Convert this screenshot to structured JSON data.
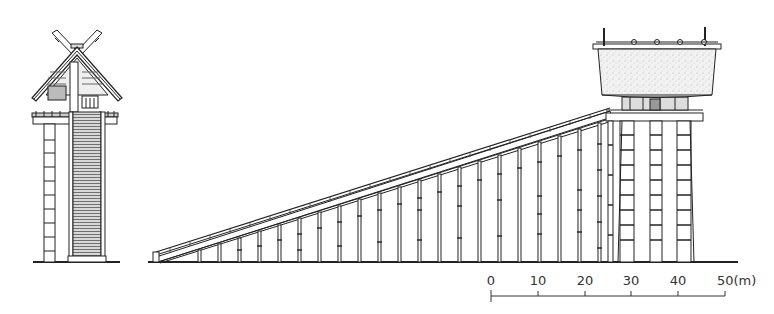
{
  "figure": {
    "type": "architectural-elevation",
    "views": [
      {
        "name": "front-elevation",
        "description": "Front view of elevated shrine with crossed roof finials (chigi) and central long staircase"
      },
      {
        "name": "side-elevation",
        "description": "Side view of elevated shrine on tall pillars with long inclined staircase supported by posts"
      }
    ],
    "colors": {
      "ink": "#222222",
      "paper": "#ffffff",
      "roof_fill": "#e9e9e9"
    }
  },
  "scale_bar": {
    "ticks": [
      "0",
      "10",
      "20",
      "30",
      "40",
      "50(m)"
    ],
    "unit": "m",
    "max": 50
  }
}
